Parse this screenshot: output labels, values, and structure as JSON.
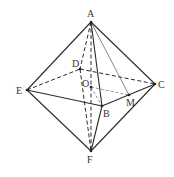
{
  "diagram": {
    "points": {
      "A": {
        "x": 91,
        "y": 22,
        "label": "A"
      },
      "B": {
        "x": 102,
        "y": 106,
        "label": "B"
      },
      "C": {
        "x": 155,
        "y": 84,
        "label": "C"
      },
      "D": {
        "x": 80,
        "y": 69,
        "label": "D"
      },
      "E": {
        "x": 27,
        "y": 90,
        "label": "E"
      },
      "F": {
        "x": 91,
        "y": 151,
        "label": "F"
      },
      "O": {
        "x": 91,
        "y": 87,
        "label": "O"
      },
      "M": {
        "x": 129,
        "y": 95,
        "label": "M"
      }
    },
    "solid_edges": [
      [
        "A",
        "E"
      ],
      [
        "A",
        "B"
      ],
      [
        "A",
        "C"
      ],
      [
        "E",
        "B"
      ],
      [
        "B",
        "C"
      ],
      [
        "E",
        "F"
      ],
      [
        "B",
        "F"
      ],
      [
        "C",
        "F"
      ]
    ],
    "thin_edges": [
      [
        "A",
        "M"
      ]
    ],
    "dashed_edges": [
      [
        "A",
        "D"
      ],
      [
        "D",
        "F"
      ],
      [
        "E",
        "D"
      ],
      [
        "D",
        "C"
      ],
      [
        "A",
        "F"
      ]
    ],
    "dashed_thin_edges": [
      [
        "O",
        "M"
      ],
      [
        "O",
        "B"
      ]
    ]
  }
}
